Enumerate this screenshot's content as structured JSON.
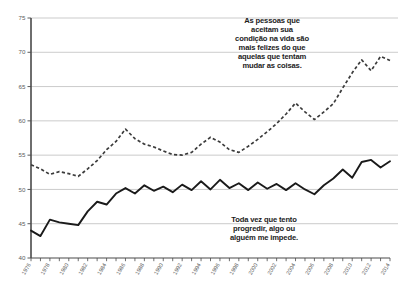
{
  "chart_data": {
    "type": "line",
    "title": "",
    "subtitle": "",
    "xlabel": "",
    "ylabel": "",
    "xlim": [
      1976,
      2014
    ],
    "ylim": [
      40,
      75
    ],
    "yticks": [
      40,
      45,
      50,
      55,
      60,
      65,
      70,
      75
    ],
    "ytick_labels": [
      "40",
      "45",
      "50",
      "55",
      "60",
      "65",
      "70",
      "75"
    ],
    "grid": "horizontal",
    "legend_position": "none",
    "x": [
      1976,
      1977,
      1978,
      1979,
      1980,
      1981,
      1982,
      1983,
      1984,
      1985,
      1986,
      1987,
      1988,
      1989,
      1990,
      1991,
      1992,
      1993,
      1994,
      1995,
      1996,
      1997,
      1998,
      1999,
      2000,
      2001,
      2002,
      2003,
      2004,
      2005,
      2006,
      2007,
      2008,
      2009,
      2010,
      2011,
      2012,
      2013,
      2014
    ],
    "xtick_labels": [
      "1976",
      "1978",
      "1980",
      "1982",
      "1984",
      "1986",
      "1988",
      "1990",
      "1992",
      "1994",
      "1996",
      "1998",
      "2000",
      "2002",
      "2004",
      "2006",
      "2008",
      "2010",
      "2012",
      "2014"
    ],
    "xtick_label_rotation": -60,
    "series": [
      {
        "name": "aceitam-sua-condicao",
        "style": "dashed",
        "color": "#3b3b3b",
        "values": [
          53.6,
          53.0,
          52.2,
          52.6,
          52.3,
          51.9,
          53.0,
          54.2,
          55.8,
          57.0,
          58.8,
          57.4,
          56.6,
          56.2,
          55.6,
          55.1,
          55.0,
          55.4,
          56.6,
          57.6,
          56.9,
          55.8,
          55.4,
          56.3,
          57.3,
          58.4,
          59.6,
          61.0,
          62.6,
          61.3,
          60.2,
          61.3,
          62.5,
          64.8,
          67.0,
          68.9,
          67.3,
          69.4,
          68.8
        ]
      },
      {
        "name": "tento-progredir",
        "style": "solid",
        "color": "#1a1a1a",
        "values": [
          44.0,
          43.2,
          45.6,
          45.2,
          45.0,
          44.8,
          46.8,
          48.2,
          47.8,
          49.4,
          50.2,
          49.4,
          50.6,
          49.8,
          50.4,
          49.6,
          50.7,
          49.9,
          51.2,
          50.0,
          51.4,
          50.2,
          50.9,
          49.9,
          51.0,
          50.1,
          50.8,
          49.9,
          50.9,
          50.0,
          49.3,
          50.6,
          51.6,
          52.9,
          51.7,
          54.0,
          54.3,
          53.2,
          54.1
        ]
      }
    ],
    "annotations": [
      {
        "name": "annotation-top",
        "text": "As pessoas que\naceitam sua\ncondição na vida são\nmais felizes do que\naquelas que tentam\nmudar as coisas."
      },
      {
        "name": "annotation-bottom",
        "text": "Toda vez que tento\nprogredir, algo ou\nalguém me impede."
      }
    ]
  },
  "colors": {
    "grid": "#b9b9b9",
    "axis": "#4a4a4a",
    "solid_series": "#1a1a1a",
    "dashed_series": "#3b3b3b",
    "tick_text": "#5d5d5d",
    "annotation_text": "#1c1c1c",
    "background": "#ffffff"
  }
}
